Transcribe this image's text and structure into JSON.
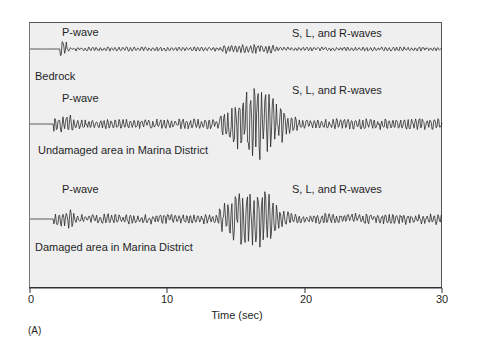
{
  "chart_data": {
    "type": "line",
    "title": "",
    "xlabel": "Time (sec)",
    "ylabel": "",
    "xlim": [
      0,
      30
    ],
    "x_ticks": [
      0,
      10,
      20,
      30
    ],
    "x_tick_labels": [
      "0",
      "10",
      "20",
      "30"
    ],
    "grid": false,
    "legend": "none",
    "panel_label": "(A)",
    "series": [
      {
        "name": "Bedrock",
        "annotations": [
          {
            "text": "P-wave",
            "x": 2.2
          },
          {
            "text": "S, L, and R-waves",
            "x": 18.5
          }
        ],
        "p_wave_onset_sec": 2.2,
        "s_wave_onset_sec": 14.0,
        "relative_max_amplitude": 0.15
      },
      {
        "name": "Undamaged area in Marina District",
        "annotations": [
          {
            "text": "P-wave",
            "x": 2.2
          },
          {
            "text": "S, L, and R-waves",
            "x": 18.5
          }
        ],
        "p_wave_onset_sec": 1.7,
        "s_wave_onset_sec": 13.8,
        "peak_time_sec": 16.5,
        "relative_max_amplitude": 1.0
      },
      {
        "name": "Damaged area in Marina District",
        "annotations": [
          {
            "text": "P-wave",
            "x": 2.2
          },
          {
            "text": "S, L, and R-waves",
            "x": 18.5
          }
        ],
        "p_wave_onset_sec": 1.7,
        "s_wave_onset_sec": 13.8,
        "peak_time_sec": 16.0,
        "relative_max_amplitude": 0.85
      }
    ]
  },
  "labels": {
    "trace1_name": "Bedrock",
    "trace1_p": "P-wave",
    "trace1_s": "S, L, and R-waves",
    "trace2_name": "Undamaged area in Marina District",
    "trace2_p": "P-wave",
    "trace2_s": "S, L, and R-waves",
    "trace3_name": "Damaged area in Marina District",
    "trace3_p": "P-wave",
    "trace3_s": "S, L, and R-waves",
    "xaxis_title": "Time (sec)",
    "tick0": "0",
    "tick10": "10",
    "tick20": "20",
    "tick30": "30",
    "panel": "(A)"
  },
  "colors": {
    "plot_bg": "#efeff0",
    "trace": "#2a2a2a"
  }
}
